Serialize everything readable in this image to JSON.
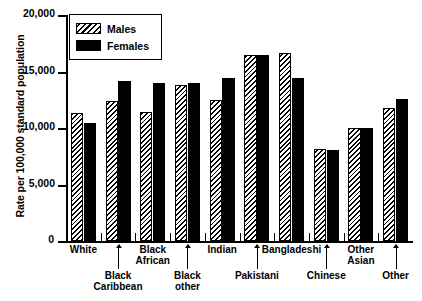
{
  "chart_data": {
    "type": "bar",
    "title": "",
    "xlabel": "",
    "ylabel": "Rate per 100,000 standard population",
    "ylim": [
      0,
      20000
    ],
    "ytick_values": [
      20000,
      15000,
      10000,
      5000,
      0
    ],
    "ytick_labels": [
      "20,000",
      "15,000",
      "10,000",
      "5,000",
      "0"
    ],
    "grid": false,
    "legend_position": "top-left",
    "categories": [
      "White",
      "Black Caribbean",
      "Black African",
      "Black other",
      "Indian",
      "Pakistani",
      "Bangladeshi",
      "Chinese",
      "Other Asian",
      "Other"
    ],
    "series": [
      {
        "name": "Males",
        "pattern": "diagonal-hatch",
        "values": [
          11300,
          12350,
          11450,
          13800,
          12500,
          16500,
          16650,
          8100,
          10000,
          11800
        ]
      },
      {
        "name": "Females",
        "pattern": "solid-black",
        "values": [
          10400,
          14200,
          13950,
          14000,
          14450,
          16450,
          14450,
          8050,
          10000,
          12600
        ]
      }
    ]
  },
  "axis": {
    "y_title": "Rate per 100,000 standard population"
  },
  "legend": {
    "entries": [
      {
        "label": "Males"
      },
      {
        "label": "Females"
      }
    ]
  },
  "x_labels": [
    {
      "text": "White",
      "leader": false
    },
    {
      "text": "Black\nCaribbean",
      "leader": true
    },
    {
      "text": "Black\nAfrican",
      "leader": false
    },
    {
      "text": "Black\nother",
      "leader": true
    },
    {
      "text": "Indian",
      "leader": false
    },
    {
      "text": "Pakistani",
      "leader": true
    },
    {
      "text": "Bangladeshi",
      "leader": false
    },
    {
      "text": "Chinese",
      "leader": true
    },
    {
      "text": "Other\nAsian",
      "leader": false
    },
    {
      "text": "Other",
      "leader": true
    }
  ],
  "clipped_header": "",
  "colors": {
    "axis": "#000000",
    "males_fill": "#ffffff",
    "females_fill": "#000000"
  }
}
